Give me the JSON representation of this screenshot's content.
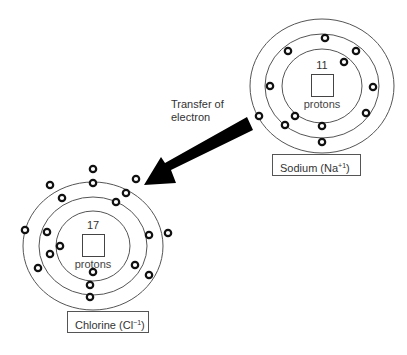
{
  "diagram": {
    "transfer": {
      "line1": "Transfer of",
      "line2": "electron"
    },
    "sodium": {
      "label_prefix": "Sodium (Na",
      "label_charge": "+1",
      "label_suffix": ")",
      "proton_count": "11",
      "proton_word": "protons",
      "shells": [
        2,
        8,
        1
      ],
      "shown_electrons": 10
    },
    "chlorine": {
      "label_prefix": "Chlorine (Cl",
      "label_charge": "−1",
      "label_suffix": ")",
      "proton_count": "17",
      "proton_word": "protons",
      "shells": [
        2,
        8,
        7
      ],
      "shown_electrons": 18
    },
    "colors": {
      "line": "#555555",
      "arrow": "#000000",
      "electron_stroke": "#111111"
    }
  }
}
